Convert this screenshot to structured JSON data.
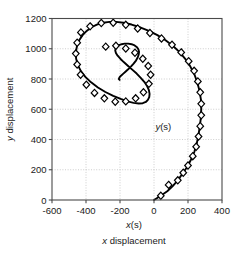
{
  "chart_data": {
    "type": "line",
    "title": "",
    "subtitle": "",
    "xlabel": "x displacement",
    "xlabel_symbol": "x(s)",
    "ylabel": "y displacement",
    "ylabel_symbol": "",
    "annotation": "y(s)",
    "grid": true,
    "legend": "none",
    "xlim": [
      -600,
      400
    ],
    "ylim": [
      0,
      1200
    ],
    "xticks": [
      -600,
      -400,
      -200,
      0,
      200,
      400
    ],
    "xtick_labels": [
      "-600",
      "-400",
      "-200",
      "0",
      "200",
      "400"
    ],
    "yticks": [
      0,
      200,
      400,
      600,
      800,
      1000,
      1200
    ],
    "ytick_labels": [
      "0",
      "200",
      "400",
      "600",
      "800",
      "1000",
      "1200"
    ],
    "marker": "diamond",
    "series": [
      {
        "name": "y(s)",
        "x": [
          0,
          40,
          78,
          110,
          140,
          166,
          195,
          218,
          238,
          252,
          262,
          270,
          276,
          278,
          276,
          268,
          255,
          238,
          214,
          186,
          152,
          112,
          68,
          20,
          -30,
          -82,
          -132,
          -180,
          -222,
          -262,
          -300,
          -336,
          -368,
          -396,
          -420,
          -440,
          -453,
          -460,
          -458,
          -448,
          -430,
          -404,
          -370,
          -330,
          -286,
          -240,
          -196,
          -156,
          -120,
          -90,
          -66,
          -48,
          -36,
          -28,
          -26,
          -30,
          -40,
          -56,
          -78,
          -102,
          -128,
          -154,
          -178,
          -198,
          -214,
          -224,
          -228,
          -226,
          -218,
          -206,
          -190,
          -172,
          -152,
          -132,
          -114,
          -100,
          -92,
          -88,
          -90,
          -96,
          -106,
          -120,
          -136,
          -152,
          -168,
          -182,
          -194,
          -202,
          -206,
          -206,
          -202
        ],
        "y": [
          0,
          28,
          58,
          92,
          130,
          172,
          218,
          268,
          320,
          376,
          432,
          490,
          548,
          606,
          664,
          720,
          776,
          830,
          882,
          930,
          976,
          1018,
          1056,
          1090,
          1118,
          1142,
          1160,
          1172,
          1178,
          1178,
          1172,
          1160,
          1142,
          1118,
          1090,
          1056,
          1018,
          976,
          934,
          892,
          852,
          814,
          778,
          744,
          714,
          688,
          668,
          652,
          642,
          638,
          640,
          648,
          662,
          680,
          702,
          726,
          752,
          780,
          808,
          836,
          862,
          888,
          912,
          934,
          954,
          972,
          988,
          1002,
          1014,
          1024,
          1030,
          1034,
          1034,
          1030,
          1022,
          1010,
          996,
          980,
          962,
          942,
          922,
          902,
          882,
          864,
          848,
          834,
          822,
          812,
          804,
          798,
          794
        ],
        "markers": [
          {
            "x": 40,
            "y": 28
          },
          {
            "x": 86,
            "y": 100
          },
          {
            "x": 140,
            "y": 130
          },
          {
            "x": 172,
            "y": 180
          },
          {
            "x": 200,
            "y": 228
          },
          {
            "x": 228,
            "y": 290
          },
          {
            "x": 248,
            "y": 352
          },
          {
            "x": 262,
            "y": 420
          },
          {
            "x": 272,
            "y": 488
          },
          {
            "x": 278,
            "y": 560
          },
          {
            "x": 278,
            "y": 636
          },
          {
            "x": 272,
            "y": 712
          },
          {
            "x": 258,
            "y": 784
          },
          {
            "x": 236,
            "y": 854
          },
          {
            "x": 204,
            "y": 918
          },
          {
            "x": 160,
            "y": 976
          },
          {
            "x": 106,
            "y": 1026
          },
          {
            "x": 44,
            "y": 1068
          },
          {
            "x": -24,
            "y": 1104
          },
          {
            "x": -96,
            "y": 1134
          },
          {
            "x": -166,
            "y": 1158
          },
          {
            "x": -240,
            "y": 1172
          },
          {
            "x": -310,
            "y": 1170
          },
          {
            "x": -376,
            "y": 1148
          },
          {
            "x": -430,
            "y": 1108
          },
          {
            "x": -452,
            "y": 1040
          },
          {
            "x": -460,
            "y": 968
          },
          {
            "x": -452,
            "y": 896
          },
          {
            "x": -432,
            "y": 828
          },
          {
            "x": -398,
            "y": 762
          },
          {
            "x": -350,
            "y": 708
          },
          {
            "x": -292,
            "y": 672
          },
          {
            "x": -228,
            "y": 650
          },
          {
            "x": -166,
            "y": 652
          },
          {
            "x": -108,
            "y": 672
          },
          {
            "x": -62,
            "y": 712
          },
          {
            "x": -30,
            "y": 768
          },
          {
            "x": -20,
            "y": 828
          },
          {
            "x": -34,
            "y": 886
          },
          {
            "x": -66,
            "y": 934
          },
          {
            "x": -112,
            "y": 974
          },
          {
            "x": -166,
            "y": 1002
          },
          {
            "x": -224,
            "y": 1020
          },
          {
            "x": -284,
            "y": 1014
          }
        ]
      }
    ]
  }
}
